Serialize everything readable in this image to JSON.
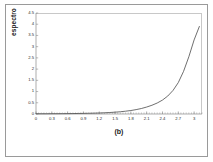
{
  "figure": {
    "caption": "(b)",
    "background_color": "#ffffff",
    "frame_color": "#9a9a9a"
  },
  "chart_data": {
    "type": "line",
    "title": "",
    "subtitle": "",
    "xlabel": "",
    "ylabel": "espectro",
    "caption": "(b)",
    "grid": false,
    "legend": null,
    "legend_position": "none",
    "line_color": "#4a4a4a",
    "xlim": [
      0,
      3.15
    ],
    "ylim": [
      0,
      4.5
    ],
    "xticks": [
      "0",
      "0.3",
      "0.6",
      "0.9",
      "1.2",
      "1.5",
      "1.8",
      "2.1",
      "2.4",
      "2.7",
      "3"
    ],
    "xtick_values": [
      0,
      0.3,
      0.6,
      0.9,
      1.2,
      1.5,
      1.8,
      2.1,
      2.4,
      2.7,
      3
    ],
    "yticks": [
      "0",
      "0.5",
      "1",
      "1.5",
      "2",
      "2.5",
      "3",
      "3.5",
      "4",
      "4.5"
    ],
    "ytick_values": [
      0,
      0.5,
      1,
      1.5,
      2,
      2.5,
      3,
      3.5,
      4,
      4.5
    ],
    "minor_xticks": true,
    "series": [
      {
        "name": "espectro",
        "x": [
          0,
          0.1,
          0.2,
          0.3,
          0.4,
          0.5,
          0.6,
          0.7,
          0.8,
          0.9,
          1.0,
          1.1,
          1.2,
          1.3,
          1.4,
          1.5,
          1.6,
          1.7,
          1.8,
          1.9,
          2.0,
          2.1,
          2.2,
          2.3,
          2.4,
          2.5,
          2.6,
          2.7,
          2.8,
          2.9,
          3.0,
          3.1
        ],
        "values": [
          0.01,
          0.01,
          0.01,
          0.012,
          0.013,
          0.015,
          0.017,
          0.02,
          0.023,
          0.027,
          0.032,
          0.038,
          0.045,
          0.055,
          0.067,
          0.082,
          0.1,
          0.125,
          0.155,
          0.195,
          0.245,
          0.31,
          0.39,
          0.49,
          0.62,
          0.8,
          1.05,
          1.4,
          1.9,
          2.55,
          3.3,
          3.9
        ]
      }
    ]
  }
}
